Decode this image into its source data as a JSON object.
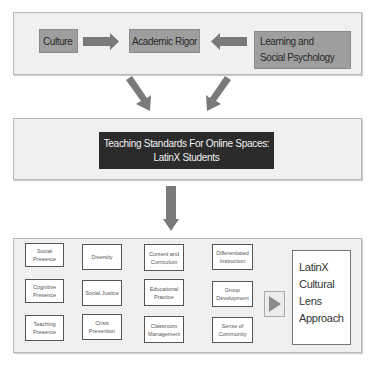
{
  "top_panel": {
    "culture": "Culture",
    "academic_rigor": "Academic Rigor",
    "learning_psychology": "Learning and Social Psychology"
  },
  "middle_panel": {
    "title_line1": "Teaching Standards For Online Spaces:",
    "title_line2": "LatinX Students"
  },
  "bottom_panel": {
    "columns": [
      [
        "Social Presence",
        "Cognitive Presence",
        "Teaching Presence"
      ],
      [
        "Diversity",
        "Social Justice",
        "Crisis Prevention"
      ],
      [
        "Content and Curriculum",
        "Educational Practice",
        "Classroom Management"
      ],
      [
        "Differentiated Instruction",
        "Group Development",
        "Sense of Community"
      ]
    ],
    "result_line1": "LatinX",
    "result_line2": "Cultural Lens",
    "result_line3": "Approach"
  },
  "colors": {
    "gray_box": "#9e9e9e",
    "arrow": "#7a7a7a",
    "dark_box": "#2b2b2b",
    "panel_bg": "#f0f0f0"
  }
}
